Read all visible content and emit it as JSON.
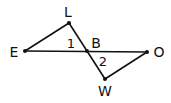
{
  "diagram": {
    "type": "geometry",
    "points": [
      {
        "id": "L",
        "label": "L",
        "x": 69,
        "y": 23,
        "lx": 68,
        "ly": 16
      },
      {
        "id": "E",
        "label": "E",
        "x": 25,
        "y": 51,
        "lx": 14,
        "ly": 56
      },
      {
        "id": "B",
        "label": "B",
        "x": 87,
        "y": 51,
        "lx": 96,
        "ly": 47
      },
      {
        "id": "O",
        "label": "O",
        "x": 147,
        "y": 52,
        "lx": 159,
        "ly": 56
      },
      {
        "id": "W",
        "label": "W",
        "x": 105,
        "y": 79,
        "lx": 105,
        "ly": 95
      }
    ],
    "segments": [
      [
        "E",
        "L"
      ],
      [
        "L",
        "W"
      ],
      [
        "E",
        "O"
      ],
      [
        "O",
        "W"
      ]
    ],
    "angle_labels": [
      {
        "label": "1",
        "x": 71,
        "y": 47
      },
      {
        "label": "2",
        "x": 103,
        "y": 65
      }
    ]
  }
}
